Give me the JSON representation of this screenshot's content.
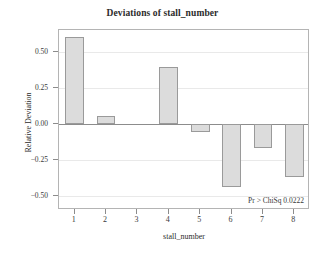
{
  "chart_data": {
    "type": "bar",
    "title": "Deviations of stall_number",
    "xlabel": "stall_number",
    "ylabel": "Relative Deviation",
    "categories": [
      "1",
      "2",
      "3",
      "4",
      "5",
      "6",
      "7",
      "8"
    ],
    "values": [
      0.6,
      0.05,
      0.0,
      0.39,
      -0.06,
      -0.44,
      -0.17,
      -0.37
    ],
    "ylim": [
      -0.6,
      0.65
    ],
    "yticks": [
      0.5,
      0.25,
      0.0,
      -0.25,
      -0.5
    ],
    "ytick_labels": [
      "0.50",
      "0.25",
      "0.00",
      "-0.25",
      "-0.50"
    ],
    "grid": true,
    "legend": "none",
    "annotations": [
      {
        "text": "Pr > ChiSq 0.0222",
        "position": "bottom-right"
      }
    ],
    "colors": {
      "bar_fill": "#dcdcdc",
      "bar_border": "#9a9a9a",
      "frame": "#b4b4b4",
      "gridline": "#e9e9e9",
      "zeroline": "#8c8c8c",
      "text": "#2b2b2b",
      "background": "#ffffff"
    }
  }
}
